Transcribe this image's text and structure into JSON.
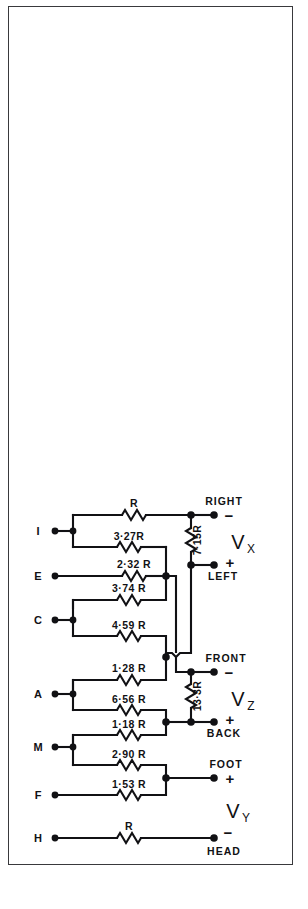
{
  "figure": {
    "kind": "circuit-schematic",
    "background_color": "#ffffff",
    "ink_color": "#111114",
    "frame_color": "#39393c",
    "input_nodes": [
      {
        "id": "I",
        "label": "I"
      },
      {
        "id": "E",
        "label": "E"
      },
      {
        "id": "C",
        "label": "C"
      },
      {
        "id": "A",
        "label": "A"
      },
      {
        "id": "M",
        "label": "M"
      },
      {
        "id": "F",
        "label": "F"
      },
      {
        "id": "H",
        "label": "H"
      }
    ],
    "resistors": [
      {
        "id": "r-top",
        "label": "R",
        "orientation": "horizontal"
      },
      {
        "id": "r-i",
        "label": "3·27R",
        "orientation": "horizontal"
      },
      {
        "id": "r-e",
        "label": "2·32 R",
        "orientation": "horizontal"
      },
      {
        "id": "r-c-upper",
        "label": "3·74 R",
        "orientation": "horizontal"
      },
      {
        "id": "r-c-lower",
        "label": "4·59 R",
        "orientation": "horizontal"
      },
      {
        "id": "r-a-upper",
        "label": "1·28 R",
        "orientation": "horizontal"
      },
      {
        "id": "r-a-lower",
        "label": "6·56 R",
        "orientation": "horizontal"
      },
      {
        "id": "r-m-upper",
        "label": "1·18 R",
        "orientation": "horizontal"
      },
      {
        "id": "r-m-lower",
        "label": "2·90 R",
        "orientation": "horizontal"
      },
      {
        "id": "r-f",
        "label": "1·53 R",
        "orientation": "horizontal"
      },
      {
        "id": "r-h",
        "label": "R",
        "orientation": "horizontal"
      },
      {
        "id": "r-vx",
        "label": "7·15R",
        "orientation": "vertical"
      },
      {
        "id": "r-vz",
        "label": "13·3R",
        "orientation": "vertical"
      }
    ],
    "output_terminals": [
      {
        "id": "right",
        "label": "RIGHT",
        "polarity": "−"
      },
      {
        "id": "left",
        "label": "LEFT",
        "polarity": "+"
      },
      {
        "id": "front",
        "label": "FRONT",
        "polarity": "−"
      },
      {
        "id": "back",
        "label": "BACK",
        "polarity": "+"
      },
      {
        "id": "foot",
        "label": "FOOT",
        "polarity": "+"
      },
      {
        "id": "head",
        "label": "HEAD",
        "polarity": "−"
      }
    ],
    "output_voltages": [
      {
        "id": "vx",
        "symbol": "V",
        "subscript": "X"
      },
      {
        "id": "vz",
        "symbol": "V",
        "subscript": "Z"
      },
      {
        "id": "vy",
        "symbol": "V",
        "subscript": "Y"
      }
    ]
  }
}
